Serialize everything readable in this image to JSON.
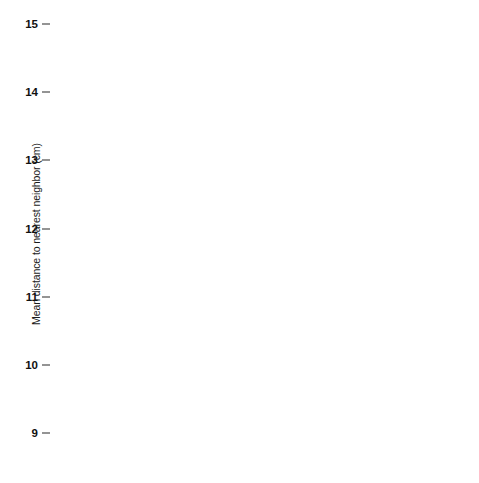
{
  "chart_data": {
    "type": "bar",
    "title": "",
    "xlabel": "",
    "ylabel": "Mean distance to nearest neighbor (cm)",
    "ylim": [
      9,
      15
    ],
    "yticks": [
      9,
      10,
      11,
      12,
      13,
      14,
      15
    ],
    "ytick_labels": [
      "9",
      "10",
      "11",
      "12",
      "13",
      "14",
      "15"
    ],
    "grid": true,
    "legend": "none",
    "panels": [
      {
        "name": "left-panel",
        "categories": [
          "nearest sibling",
          "nearest nonsibling",
          "nearest sibling",
          "nearest nonsibling"
        ],
        "category_lines": [
          [
            "nearest",
            "sibling"
          ],
          [
            "nearest",
            "nonsibling"
          ],
          [
            "nearest",
            "sibling"
          ],
          [
            "nearest",
            "nonsibling"
          ]
        ],
        "values": [
          10.3,
          11.15,
          12.2,
          14.25
        ],
        "colors": [
          "#4a4a4a",
          "#4a4a4a",
          "#72c2ea",
          "#72c2ea"
        ]
      },
      {
        "name": "right-panel",
        "categories": [
          "nearest full sibling",
          "nearest maternal half sibling",
          "nearest full sibling",
          "nearest paternal half sibling"
        ],
        "category_lines": [
          [
            "nearest",
            "full",
            "sibling"
          ],
          [
            "nearest",
            "maternal",
            "half sibling"
          ],
          [
            "nearest",
            "full",
            "sibling"
          ],
          [
            "nearest",
            "paternal",
            "half sibling"
          ]
        ],
        "values": [
          12.27,
          12.43,
          11.15,
          13.1
        ],
        "colors": [
          "#72c2ea",
          "#72c2ea",
          "#72c2ea",
          "#72c2ea"
        ]
      }
    ]
  },
  "colors": {
    "bar_dark": "#4a4a4a",
    "bar_blue": "#72c2ea",
    "axis": "#2e2e2e",
    "background": "#ffffff"
  }
}
